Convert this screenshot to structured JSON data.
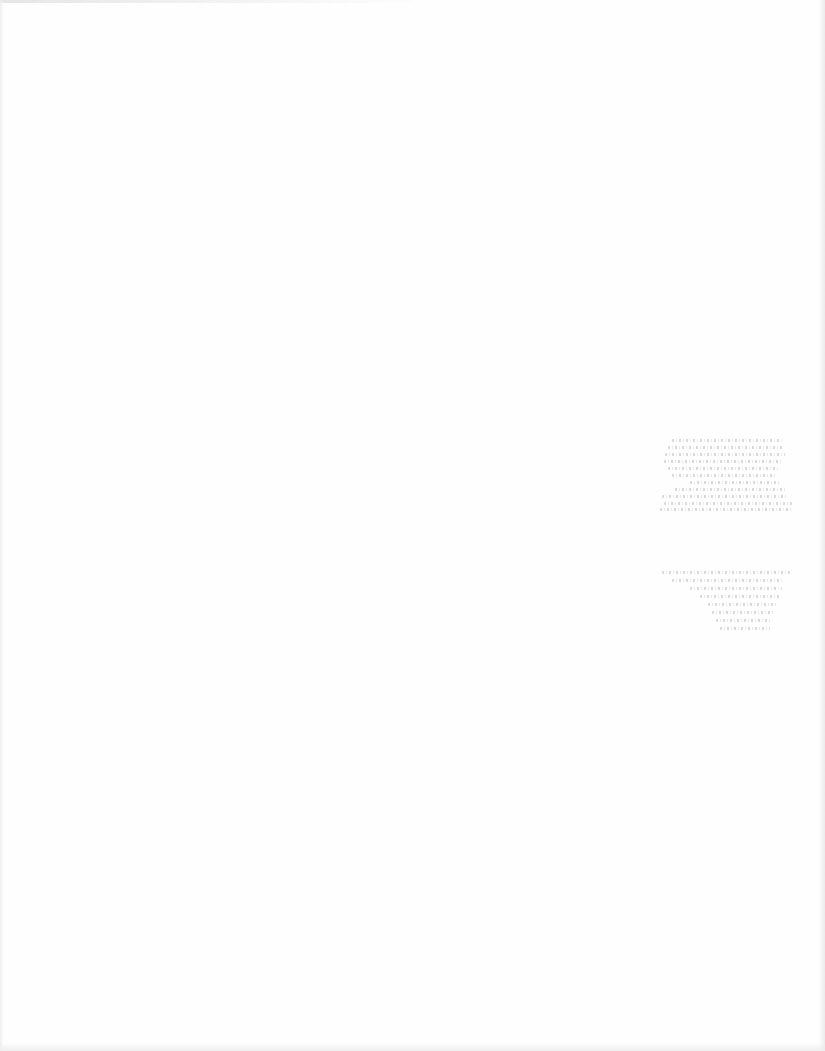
{
  "document": {
    "type": "scanned-page",
    "background_color": "#fefefe",
    "legible_text": [],
    "bleed_through_blocks": [
      {
        "region": "right-middle-upper",
        "legible": false,
        "line_count": 11,
        "lines": [
          {
            "x": 672,
            "y": 439,
            "w": 110
          },
          {
            "x": 668,
            "y": 446,
            "w": 114
          },
          {
            "x": 665,
            "y": 453,
            "w": 120
          },
          {
            "x": 664,
            "y": 460,
            "w": 118
          },
          {
            "x": 668,
            "y": 467,
            "w": 110
          },
          {
            "x": 672,
            "y": 474,
            "w": 105
          },
          {
            "x": 690,
            "y": 481,
            "w": 90
          },
          {
            "x": 675,
            "y": 488,
            "w": 112
          },
          {
            "x": 662,
            "y": 495,
            "w": 126
          },
          {
            "x": 664,
            "y": 502,
            "w": 128
          },
          {
            "x": 660,
            "y": 508,
            "w": 132
          }
        ]
      },
      {
        "region": "right-middle-lower",
        "legible": false,
        "line_count": 8,
        "lines": [
          {
            "x": 662,
            "y": 571,
            "w": 128
          },
          {
            "x": 672,
            "y": 579,
            "w": 110
          },
          {
            "x": 690,
            "y": 587,
            "w": 92
          },
          {
            "x": 700,
            "y": 595,
            "w": 80
          },
          {
            "x": 708,
            "y": 603,
            "w": 70
          },
          {
            "x": 712,
            "y": 611,
            "w": 62
          },
          {
            "x": 716,
            "y": 619,
            "w": 56
          },
          {
            "x": 720,
            "y": 627,
            "w": 50
          }
        ]
      }
    ]
  }
}
